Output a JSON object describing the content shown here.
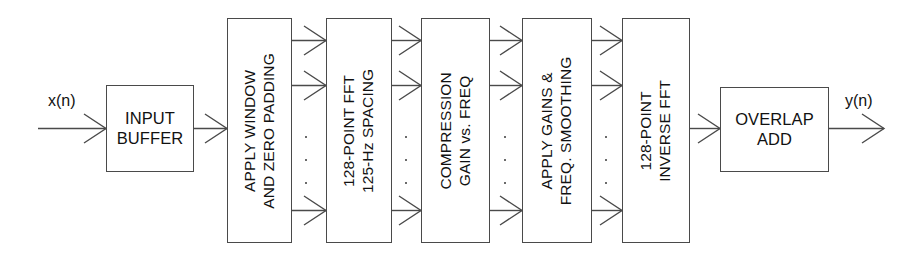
{
  "diagram": {
    "input_label": "x(n)",
    "output_label": "y(n)",
    "stroke_color": "#4a4a4a",
    "text_color": "#111111",
    "background_color": "#ffffff",
    "stages": [
      {
        "id": "input-buffer",
        "orientation": "horizontal",
        "lines": [
          "INPUT",
          "BUFFER"
        ],
        "text": "INPUT BUFFER"
      },
      {
        "id": "apply-window-zero-padding",
        "orientation": "vertical",
        "lines": [
          "APPLY WINDOW",
          "AND ZERO PADDING"
        ],
        "text": "APPLY WINDOW AND ZERO PADDING"
      },
      {
        "id": "fft-128-point",
        "orientation": "vertical",
        "lines": [
          "128-POINT FFT",
          "125-Hz SPACING"
        ],
        "text": "128-POINT FFT 125-Hz SPACING"
      },
      {
        "id": "compression-gain-vs-freq",
        "orientation": "vertical",
        "lines": [
          "COMPRESSION",
          "GAIN vs. FREQ"
        ],
        "text": "COMPRESSION GAIN vs. FREQ"
      },
      {
        "id": "apply-gains-freq-smoothing",
        "orientation": "vertical",
        "lines": [
          "APPLY GAINS &",
          "FREQ. SMOOTHING"
        ],
        "text": "APPLY GAINS & FREQ. SMOOTHING"
      },
      {
        "id": "inverse-fft-128-point",
        "orientation": "vertical",
        "lines": [
          "128-POINT",
          "INVERSE FFT"
        ],
        "text": "128-POINT INVERSE FFT"
      },
      {
        "id": "overlap-add",
        "orientation": "horizontal",
        "lines": [
          "OVERLAP",
          "ADD"
        ],
        "text": "OVERLAP ADD"
      }
    ],
    "bus_ellipsis": "⋮"
  }
}
